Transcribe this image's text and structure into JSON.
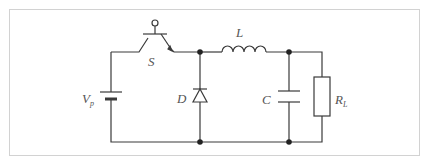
{
  "diagram": {
    "type": "circuit",
    "colors": {
      "wire": "#3a3a3a",
      "label": "#555555",
      "frame": "#d2d2d2"
    },
    "components": [
      {
        "id": "Vp",
        "kind": "battery",
        "label": "V",
        "subscript": "p"
      },
      {
        "id": "S",
        "kind": "transistor-switch",
        "label": "S"
      },
      {
        "id": "D",
        "kind": "diode",
        "label": "D"
      },
      {
        "id": "L",
        "kind": "inductor",
        "label": "L"
      },
      {
        "id": "C",
        "kind": "capacitor",
        "label": "C"
      },
      {
        "id": "RL",
        "kind": "resistor",
        "label": "R",
        "subscript": "L"
      }
    ],
    "nodes": 4
  }
}
